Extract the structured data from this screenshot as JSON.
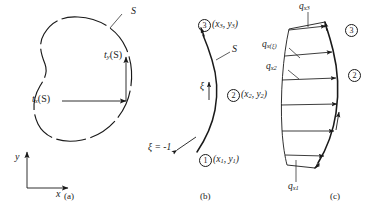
{
  "figure": {
    "panels": [
      {
        "id": "a",
        "caption": "(a)",
        "labels": {
          "surface": "S",
          "traction_y": "t",
          "traction_y_sub": "y",
          "traction_y_arg": "(S)",
          "traction_x": "t",
          "traction_x_sub": "x",
          "traction_x_arg": "(S)",
          "axis_x": "x",
          "axis_y": "y"
        }
      },
      {
        "id": "b",
        "caption": "(b)",
        "labels": {
          "surface": "S",
          "xi": "ξ",
          "xi_start": "ξ = -1",
          "node1_num": "1",
          "node1_coords": "(x",
          "node1_sub1": "1",
          "node1_mid": ", y",
          "node1_sub2": "1",
          "node1_end": ")",
          "node2_num": "2",
          "node2_coords": "(x",
          "node2_sub1": "2",
          "node2_mid": ", y",
          "node2_sub2": "2",
          "node2_end": ")",
          "node3_num": "3",
          "node3_coords": "(x",
          "node3_sub1": "3",
          "node3_mid": ", y",
          "node3_sub2": "3",
          "node3_end": ")"
        }
      },
      {
        "id": "c",
        "caption": "(c)",
        "labels": {
          "q_x3": "q",
          "q_x3_sub": "x3",
          "q_xxi": "q",
          "q_xxi_sub": "x(ξ)",
          "q_x2": "q",
          "q_x2_sub": "x2",
          "q_x1": "q",
          "q_x1_sub": "x1",
          "node2_num": "2",
          "node3_num": "3"
        }
      }
    ],
    "colors": {
      "ink": "#1a1a1a",
      "background": "#ffffff"
    }
  }
}
